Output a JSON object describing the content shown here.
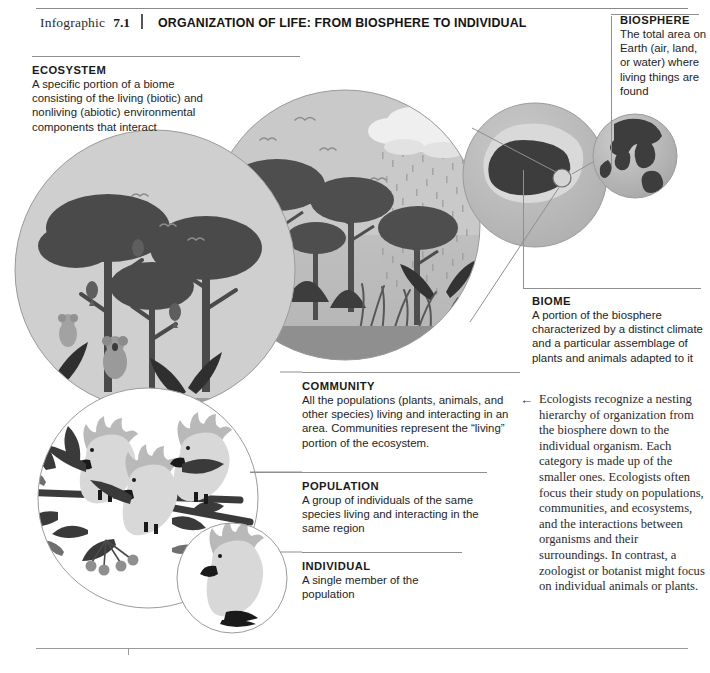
{
  "header": {
    "label": "Infographic",
    "number": "7.1",
    "title": "ORGANIZATION OF LIFE: FROM BIOSPHERE TO INDIVIDUAL"
  },
  "callouts": [
    {
      "id": "biosphere",
      "title": "BIOSPHERE",
      "body": "The total area on Earth (air, land, or water) where living things are found"
    },
    {
      "id": "ecosystem",
      "title": "ECOSYSTEM",
      "body": "A specific portion of a biome consisting of the living (biotic) and nonliving (abiotic) environmental components that interact"
    },
    {
      "id": "biome",
      "title": "BIOME",
      "body": "A portion of the biosphere characterized by a distinct climate and a particular assemblage of plants and animals adapted to it"
    },
    {
      "id": "community",
      "title": "COMMUNITY",
      "body": "All the populations (plants, animals, and other species) living and interacting in an area. Communities represent the “living” portion of the ecosystem."
    },
    {
      "id": "population",
      "title": "POPULATION",
      "body": "A group of individuals of the same species living and interacting in the same region"
    },
    {
      "id": "individual",
      "title": "INDIVIDUAL",
      "body": "A single member of the population"
    }
  ],
  "note": {
    "arrow": "←",
    "text": "Ecologists recognize a nesting hierarchy of organization from the biosphere down to the individual organism. Each category is made up of the smaller ones. Ecologists often focus their study on populations, communities, and ecosystems, and the interactions between organisms and their surroundings. In contrast, a zoologist or botanist might focus on individual animals or plants."
  },
  "artwork": {
    "scenes": [
      {
        "name": "globe-biosphere",
        "desc": "Gray globe showing continents"
      },
      {
        "name": "biome-map",
        "desc": "Circle with dark Australia landmass"
      },
      {
        "name": "ecosystem-scene",
        "desc": "Rainforest with clouds and rain"
      },
      {
        "name": "community-scene",
        "desc": "Forest trees, birds, koalas"
      },
      {
        "name": "population-scene",
        "desc": "Three cockatoos on a branch"
      },
      {
        "name": "individual-scene",
        "desc": "A single cockatoo"
      }
    ],
    "colors": {
      "circle_fill": "#bfbfbf",
      "circle_fill_light": "#d4d4d4",
      "silhouette_dark": "#4a4a4a",
      "silhouette_darker": "#3a3a3a",
      "outline": "#8f8f8f",
      "bird_body": "#d8d8d8",
      "bird_accent": "#111111"
    }
  }
}
